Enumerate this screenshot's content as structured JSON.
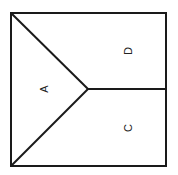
{
  "diagram": {
    "type": "partitioned-square",
    "regions": [
      {
        "id": "A",
        "label": "A",
        "x": 44,
        "y": 89
      },
      {
        "id": "D",
        "label": "D",
        "x": 128,
        "y": 51
      },
      {
        "id": "C",
        "label": "C",
        "x": 128,
        "y": 128
      }
    ],
    "stroke_color": "#1a1a1a",
    "label_rotation_deg": -90
  }
}
